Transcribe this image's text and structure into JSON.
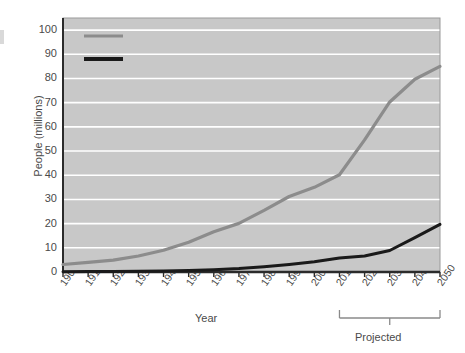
{
  "chart_data": {
    "type": "line",
    "title": "",
    "xlabel": "Year",
    "ylabel": "People (millions)",
    "xlim": [
      1900,
      2050
    ],
    "ylim": [
      0,
      105
    ],
    "ytick_values": [
      0,
      10,
      20,
      30,
      40,
      50,
      60,
      70,
      80,
      90,
      100
    ],
    "ytick_labels": [
      "0",
      "10",
      "20",
      "30",
      "40",
      "50",
      "60",
      "70",
      "80",
      "90",
      "100"
    ],
    "xtick_labels": [
      "1900",
      "1910",
      "1920",
      "1930",
      "1940",
      "1950",
      "1960",
      "1970",
      "1980",
      "1990",
      "2000",
      "2010",
      "2020",
      "2030",
      "2040",
      "2050"
    ],
    "x": [
      1900,
      1910,
      1920,
      1930,
      1940,
      1950,
      1960,
      1970,
      1980,
      1990,
      2000,
      2010,
      2020,
      2030,
      2040,
      2050
    ],
    "grid": "horizontal",
    "legend_position": "top-left",
    "plot_background": "#c8c8c8",
    "gridline_color": "#ffffff",
    "series": [
      {
        "name": "65 and over",
        "color": "#8c8c8c",
        "values": [
          3.1,
          4.0,
          4.9,
          6.6,
          9.0,
          12.3,
          16.6,
          20.1,
          25.5,
          31.2,
          35.0,
          40.2,
          54.6,
          70.3,
          79.7,
          85.0
        ]
      },
      {
        "name": "85 and over",
        "color": "#1a1a1a",
        "values": [
          0.1,
          0.2,
          0.2,
          0.3,
          0.4,
          0.6,
          0.9,
          1.4,
          2.2,
          3.1,
          4.2,
          5.8,
          6.6,
          8.9,
          14.2,
          19.7
        ]
      }
    ],
    "annotations": [
      {
        "name": "projected-bracket",
        "label": "Projected",
        "x_start": 2010,
        "x_end": 2050
      }
    ]
  },
  "legend": {
    "items": [
      {
        "label": "65 and over",
        "color": "#8c8c8c"
      },
      {
        "label": "85 and over",
        "color": "#1a1a1a"
      }
    ]
  }
}
